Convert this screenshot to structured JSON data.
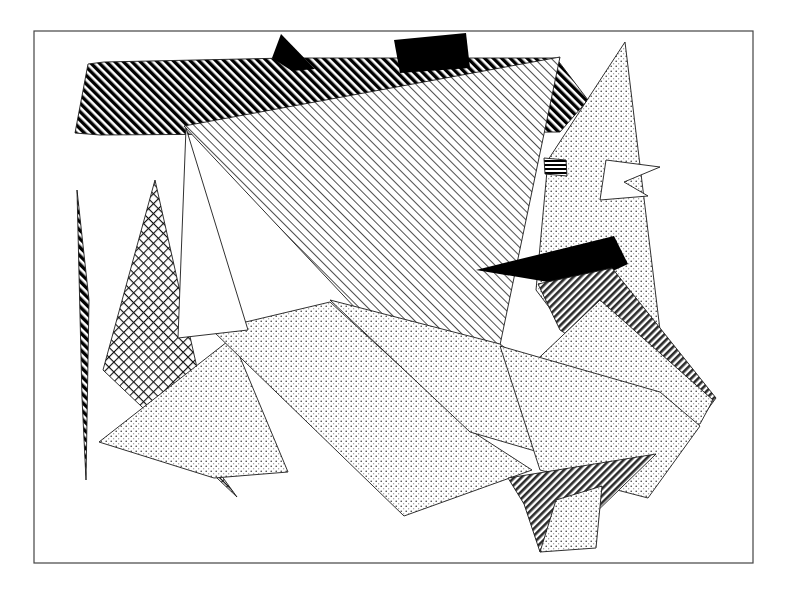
{
  "figure": {
    "canvas": {
      "width": 792,
      "height": 595,
      "background": "#ffffff"
    },
    "frame": {
      "name": "artwork-border",
      "x": 34,
      "y": 31,
      "width": 719,
      "height": 532,
      "stroke": "#444444",
      "stroke_width": 1.2,
      "fill": "none"
    },
    "palette": {
      "ink": "#000000",
      "line": "#1a1a1a",
      "frame": "#444444",
      "paper": "#ffffff",
      "dark_stripe": "#2b2b2b",
      "light_hatch": "#3a3a3a"
    },
    "fill_patterns": [
      {
        "id": "solid-black",
        "label": "solid black",
        "kind": "solid"
      },
      {
        "id": "heavy-diagonal-hatch",
        "label": "heavy diagonal hatch",
        "kind": "lines",
        "angle": -45,
        "spacing": 6,
        "weight": 3.4
      },
      {
        "id": "fine-diagonal-hatch",
        "label": "fine diagonal hatch",
        "kind": "lines",
        "angle": -45,
        "spacing": 6,
        "weight": 0.9
      },
      {
        "id": "dense-dark-stripe",
        "label": "dense dark stripe",
        "kind": "lines",
        "angle": 45,
        "spacing": 5,
        "weight": 2.6
      },
      {
        "id": "cross-hatch",
        "label": "diagonal cross hatch",
        "kind": "grid",
        "angle": 45,
        "spacing": 7,
        "weight": 1.1
      },
      {
        "id": "fine-stipple",
        "label": "fine dot stipple",
        "kind": "dots",
        "spacing": 5,
        "radius": 0.75
      },
      {
        "id": "horizontal-stripe",
        "label": "horizontal stripe",
        "kind": "lines",
        "angle": 0,
        "spacing": 4,
        "weight": 2
      },
      {
        "id": "blank",
        "label": "blank white",
        "kind": "none"
      }
    ],
    "shapes": [
      {
        "name": "top-heavy-hatch-band",
        "pattern": "heavy-diagonal-hatch",
        "points": "88,64 104,62 288,58 556,58 588,100 560,132 100,135 75,133"
      },
      {
        "name": "upper-right-black-quad",
        "pattern": "solid-black",
        "points": "394,40 466,33 470,68 400,73"
      },
      {
        "name": "top-dark-spike",
        "pattern": "solid-black",
        "points": "281,34 315,69 292,71 272,58"
      },
      {
        "name": "central-large-hatch-triangle",
        "pattern": "fine-diagonal-hatch",
        "points": "184,126 560,57 500,345 470,430"
      },
      {
        "name": "right-tall-stipple-spike",
        "pattern": "fine-stipple",
        "points": "625,42 660,330 598,372 536,290 548,160"
      },
      {
        "name": "right-upper-white-notch",
        "pattern": "blank",
        "points": "606,160 660,167 624,182 648,196 600,200"
      },
      {
        "name": "mid-right-horizontal-stripe-sliver",
        "pattern": "horizontal-stripe",
        "points": "544,158 566,160 567,176 545,174"
      },
      {
        "name": "mid-right-black-dart",
        "pattern": "solid-black",
        "points": "476,270 614,236 628,264 576,288 548,282"
      },
      {
        "name": "right-dense-stripe-band",
        "pattern": "dense-dark-stripe",
        "points": "538,284 612,268 716,398 700,420 560,330"
      },
      {
        "name": "right-lower-stipple-wing",
        "pattern": "fine-stipple",
        "points": "600,300 713,400 700,424 640,430 524,372"
      },
      {
        "name": "left-thin-hatch-sliver",
        "pattern": "heavy-diagonal-hatch",
        "points": "77,190 89,300 86,480 82,398"
      },
      {
        "name": "left-cross-hatch-triangle",
        "pattern": "cross-hatch",
        "points": "155,180 221,475 237,497 103,370"
      },
      {
        "name": "lower-left-stipple-triangle",
        "pattern": "fine-stipple",
        "points": "99,442 232,338 288,472 214,478"
      },
      {
        "name": "center-lower-stipple-field",
        "pattern": "fine-stipple",
        "points": "212,330 330,302 470,430 532,470 404,516"
      },
      {
        "name": "center-right-stipple-field",
        "pattern": "fine-stipple",
        "points": "330,300 500,344 618,432 600,470 470,432"
      },
      {
        "name": "bottom-right-stipple-panel",
        "pattern": "fine-stipple",
        "points": "500,346 660,392 700,426 648,498 540,470"
      },
      {
        "name": "bottom-dark-stripe-wedge",
        "pattern": "dense-dark-stripe",
        "points": "508,478 656,454 588,520 540,552 524,504"
      },
      {
        "name": "bottom-small-stipple-tail",
        "pattern": "fine-stipple",
        "points": "556,500 602,486 596,548 540,552"
      },
      {
        "name": "center-white-triangle",
        "pattern": "blank",
        "points": "186,128 248,330 178,338"
      }
    ]
  }
}
